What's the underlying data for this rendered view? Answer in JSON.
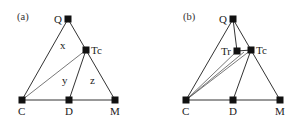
{
  "panels": [
    {
      "label": "(a)",
      "nodes": {
        "Q": {
          "label": "Q",
          "x": 68,
          "y": 19
        },
        "Tc": {
          "label": "Tc",
          "x": 86,
          "y": 50
        },
        "C": {
          "label": "C",
          "x": 22,
          "y": 100
        },
        "D": {
          "label": "D",
          "x": 69,
          "y": 100
        },
        "M": {
          "label": "M",
          "x": 115,
          "y": 100
        }
      },
      "regions": {
        "x": "x",
        "y": "y",
        "z": "z"
      }
    },
    {
      "label": "(b)",
      "nodes": {
        "Q": {
          "label": "Q",
          "x": 233,
          "y": 19
        },
        "Tr": {
          "label": "Tr",
          "x": 237,
          "y": 51
        },
        "Tc": {
          "label": "Tc",
          "x": 251,
          "y": 50
        },
        "C": {
          "label": "C",
          "x": 186,
          "y": 100
        },
        "D": {
          "label": "D",
          "x": 233,
          "y": 100
        },
        "M": {
          "label": "M",
          "x": 280,
          "y": 100
        }
      }
    }
  ]
}
